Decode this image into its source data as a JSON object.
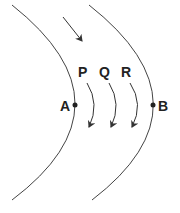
{
  "diagram": {
    "curves": [
      {
        "name": "left-curve",
        "path": "M12,5 Q138,105 12,200"
      },
      {
        "name": "right-curve",
        "path": "M89,5 Q216,105 92,200"
      }
    ],
    "points": [
      {
        "label": "A",
        "x": 75,
        "y": 105
      },
      {
        "label": "B",
        "x": 153,
        "y": 105
      }
    ],
    "arrow_labels": [
      "P",
      "Q",
      "R"
    ],
    "stroke_color": "#333333"
  }
}
